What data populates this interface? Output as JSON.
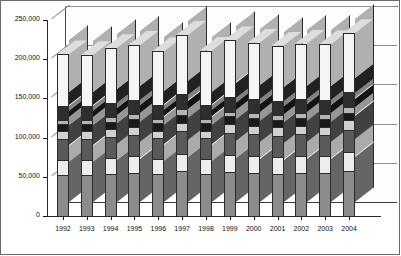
{
  "chart_data": {
    "type": "bar",
    "subtype": "stacked-column-3d",
    "title": "",
    "xlabel": "",
    "ylabel": "MT",
    "unit_label": "MT",
    "ylim": [
      0,
      250000
    ],
    "ytick_labels": [
      "0",
      "50,000",
      "100,000",
      "150,000",
      "200,000",
      "250,000"
    ],
    "ytick_values": [
      0,
      50000,
      100000,
      150000,
      200000,
      250000
    ],
    "grid": true,
    "legend": "none",
    "categories": [
      "1992",
      "1993",
      "1994",
      "1995",
      "1996",
      "1997",
      "1998",
      "1999",
      "2000",
      "2001",
      "2002",
      "2003",
      "2004"
    ],
    "totals": [
      206000,
      205000,
      214000,
      218000,
      210000,
      231000,
      211000,
      224000,
      221000,
      217000,
      220000,
      219000,
      233000
    ],
    "series": [
      {
        "name": "segment-1",
        "color": "#8c8c8c",
        "values": [
          52000,
          52000,
          53000,
          55000,
          53000,
          57000,
          53000,
          56000,
          55000,
          54000,
          55000,
          55000,
          58000
        ]
      },
      {
        "name": "segment-2",
        "color": "#ededed",
        "values": [
          20000,
          20000,
          21000,
          21000,
          20000,
          22000,
          20000,
          22000,
          21000,
          21000,
          21000,
          21000,
          23000
        ]
      },
      {
        "name": "segment-3",
        "color": "#5a5a5a",
        "values": [
          26000,
          26000,
          27000,
          27000,
          26000,
          29000,
          26000,
          28000,
          28000,
          27000,
          28000,
          27000,
          29000
        ]
      },
      {
        "name": "segment-4",
        "color": "#d0d0d0",
        "values": [
          10000,
          10000,
          10000,
          11000,
          10000,
          11000,
          10000,
          11000,
          11000,
          11000,
          11000,
          11000,
          12000
        ]
      },
      {
        "name": "segment-5",
        "color": "#1a1a1a",
        "values": [
          9000,
          9000,
          9000,
          10000,
          9000,
          10000,
          9000,
          10000,
          10000,
          10000,
          10000,
          10000,
          10000
        ]
      },
      {
        "name": "segment-6",
        "color": "#b5b5b5",
        "values": [
          6000,
          6000,
          6000,
          6000,
          6000,
          7000,
          6000,
          6000,
          6000,
          6000,
          6000,
          6000,
          7000
        ]
      },
      {
        "name": "segment-7",
        "color": "#2e2e2e",
        "values": [
          17000,
          17000,
          18000,
          18000,
          17000,
          19000,
          17000,
          19000,
          18000,
          18000,
          18000,
          18000,
          19000
        ]
      },
      {
        "name": "segment-8",
        "color": "#f5f5f5",
        "values": [
          66000,
          65000,
          70000,
          70000,
          69000,
          76000,
          70000,
          72000,
          72000,
          70000,
          71000,
          71000,
          75000
        ]
      }
    ]
  }
}
